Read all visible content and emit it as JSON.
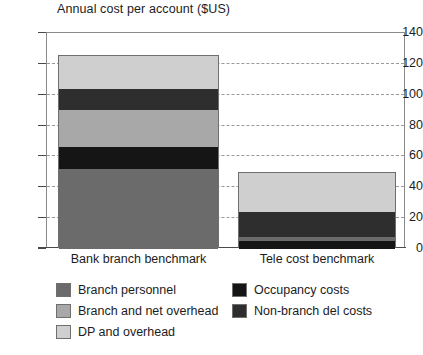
{
  "chart_data": {
    "type": "bar",
    "subtype": "stacked-bar",
    "title": "Annual cost per account ($US)",
    "xlabel": "",
    "ylabel": "",
    "ylim": [
      0,
      140
    ],
    "yticks": [
      0,
      20,
      40,
      60,
      80,
      100,
      120,
      140
    ],
    "ytick_labels": [
      "0",
      "20",
      "40",
      "60",
      "80",
      "100",
      "120",
      "140"
    ],
    "grid": true,
    "grid_axis": "y",
    "grid_style": "dashed",
    "legend_position": "below",
    "legend_columns": 2,
    "categories": [
      "Bank branch benchmark",
      "Tele cost benchmark"
    ],
    "series": [
      {
        "name": "Branch personnel",
        "color": "#6b6b6b",
        "values": [
          52,
          3
        ]
      },
      {
        "name": "Occupancy costs",
        "color": "#151515",
        "values": [
          14,
          5
        ]
      },
      {
        "name": "Branch and net overhead",
        "color": "#a8a8a8",
        "values": [
          24,
          0
        ]
      },
      {
        "name": "Non-branch del costs",
        "color": "#2e2e2e",
        "values": [
          14,
          16
        ]
      },
      {
        "name": "DP and overhead",
        "color": "#cfcfcf",
        "values": [
          21,
          25
        ]
      }
    ],
    "totals": [
      125,
      49
    ],
    "stack_order_bottom_to_top": [
      "Branch personnel",
      "Occupancy costs",
      "Branch and net overhead",
      "Non-branch del costs",
      "DP and overhead"
    ],
    "bar_stacks": [
      {
        "category": "Bank branch benchmark",
        "total": 125,
        "segments": [
          {
            "name": "Branch personnel",
            "from": 0,
            "to": 52,
            "value": 52
          },
          {
            "name": "Occupancy costs",
            "from": 52,
            "to": 66,
            "value": 14
          },
          {
            "name": "Branch and net overhead",
            "from": 66,
            "to": 90,
            "value": 24
          },
          {
            "name": "Non-branch del costs",
            "from": 90,
            "to": 104,
            "value": 14
          },
          {
            "name": "DP and overhead",
            "from": 104,
            "to": 125,
            "value": 21
          }
        ]
      },
      {
        "category": "Tele cost benchmark",
        "total": 49,
        "segments": [
          {
            "name": "Occupancy costs",
            "from": 0,
            "to": 5,
            "value": 5
          },
          {
            "name": "Branch personnel",
            "from": 5,
            "to": 8,
            "value": 3
          },
          {
            "name": "Non-branch del costs",
            "from": 8,
            "to": 24,
            "value": 16
          },
          {
            "name": "DP and overhead",
            "from": 24,
            "to": 49,
            "value": 25
          }
        ]
      }
    ]
  },
  "legend": {
    "items": [
      {
        "label": "Branch personnel",
        "color": "#6b6b6b"
      },
      {
        "label": "Branch and net overhead",
        "color": "#a8a8a8"
      },
      {
        "label": "DP and overhead",
        "color": "#cfcfcf"
      },
      {
        "label": "Occupancy costs",
        "color": "#151515"
      },
      {
        "label": "Non-branch del costs",
        "color": "#2e2e2e"
      }
    ]
  },
  "colors": {
    "axis": "#4a4a4a",
    "frame": "#8a8a8a",
    "grid": "#9a9a9a",
    "text": "#1c1c1c",
    "background": "#ffffff",
    "bar_border": "#6f6f6f"
  }
}
